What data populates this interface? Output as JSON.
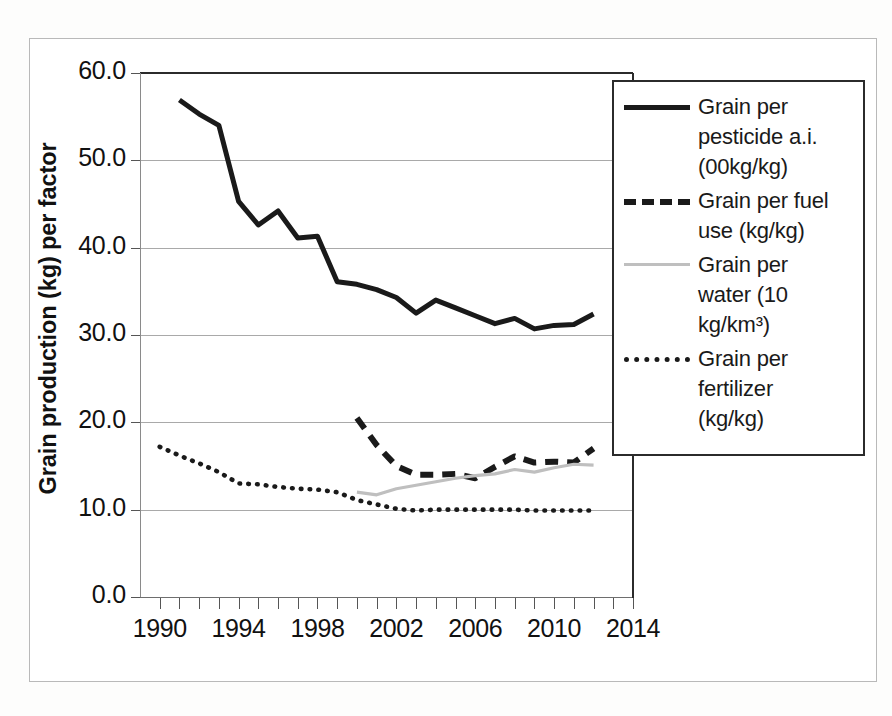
{
  "chart_data": {
    "type": "line",
    "title": "",
    "xlabel": "",
    "ylabel": "Grain production (kg) per factor",
    "xlim": [
      1989,
      2014
    ],
    "ylim": [
      0.0,
      60.0
    ],
    "grid": true,
    "legend_position": "right-inside",
    "y_ticks": [
      "60.0",
      "50.0",
      "40.0",
      "30.0",
      "20.0",
      "10.0",
      "0.0"
    ],
    "y_tick_values": [
      60.0,
      50.0,
      40.0,
      30.0,
      20.0,
      10.0,
      0.0
    ],
    "x_ticks": [
      "1990",
      "1994",
      "1998",
      "2002",
      "2006",
      "2010",
      "2014"
    ],
    "x_tick_values": [
      1990,
      1994,
      1998,
      2002,
      2006,
      2010,
      2014
    ],
    "series": [
      {
        "name": "Grain per pesticide a.i. (00kg/kg)",
        "style": "solid",
        "color": "#1a1a1a",
        "x": [
          1991,
          1992,
          1993,
          1994,
          1995,
          1996,
          1997,
          1998,
          1999,
          2000,
          2001,
          2002,
          2003,
          2004,
          2005,
          2006,
          2007,
          2008,
          2009,
          2010,
          2011,
          2012
        ],
        "values": [
          56.9,
          55.3,
          54.0,
          45.3,
          42.6,
          44.2,
          41.1,
          41.3,
          36.1,
          35.8,
          35.2,
          34.3,
          32.5,
          34.0,
          33.1,
          32.2,
          31.3,
          31.9,
          30.7,
          31.1,
          31.2,
          32.4
        ]
      },
      {
        "name": "Grain per fuel use (kg/kg)",
        "style": "dashed",
        "color": "#1a1a1a",
        "x": [
          2000,
          2001,
          2002,
          2003,
          2004,
          2005,
          2006,
          2007,
          2008,
          2009,
          2010,
          2011,
          2012
        ],
        "values": [
          20.5,
          17.4,
          15.0,
          14.0,
          14.0,
          14.1,
          13.6,
          14.9,
          16.1,
          15.4,
          15.5,
          15.4,
          17.0
        ]
      },
      {
        "name": "Grain per water (10 kg/km³)",
        "style": "solid-grey",
        "color": "#bfbfbf",
        "x": [
          2000,
          2001,
          2002,
          2003,
          2004,
          2005,
          2006,
          2007,
          2008,
          2009,
          2010,
          2011,
          2012
        ],
        "values": [
          12.0,
          11.7,
          12.4,
          12.8,
          13.2,
          13.6,
          13.9,
          14.1,
          14.6,
          14.3,
          14.8,
          15.2,
          15.1
        ]
      },
      {
        "name": "Grain per fertilizer (kg/kg)",
        "style": "dotted",
        "color": "#1a1a1a",
        "x": [
          1990,
          1991,
          1992,
          1993,
          1994,
          1995,
          1996,
          1997,
          1998,
          1999,
          2000,
          2001,
          2002,
          2003,
          2004,
          2005,
          2006,
          2007,
          2008,
          2009,
          2010,
          2011,
          2012
        ],
        "values": [
          17.2,
          16.2,
          15.3,
          14.3,
          13.0,
          12.9,
          12.6,
          12.4,
          12.3,
          12.0,
          11.1,
          10.6,
          10.1,
          9.9,
          10.0,
          10.0,
          10.0,
          10.0,
          10.0,
          9.9,
          9.9,
          9.9,
          9.9
        ]
      }
    ]
  },
  "axes": {
    "y_title": "Grain production (kg) per factor",
    "y_tick_labels": [
      "60.0",
      "50.0",
      "40.0",
      "30.0",
      "20.0",
      "10.0",
      "0.0"
    ],
    "x_tick_labels": [
      "1990",
      "1994",
      "1998",
      "2002",
      "2006",
      "2010",
      "2014"
    ]
  },
  "legend": {
    "items": [
      {
        "marker": "solid-line",
        "label": "Grain per\npesticide a.i.\n(00kg/kg)"
      },
      {
        "marker": "dashed-line",
        "label": "Grain per fuel\nuse (kg/kg)"
      },
      {
        "marker": "grey-line",
        "label": "Grain per\nwater (10\nkg/km³)"
      },
      {
        "marker": "dotted-line",
        "label": "Grain per\nfertilizer\n(kg/kg)"
      }
    ]
  },
  "caption": {
    "text": ""
  },
  "colors": {
    "series_primary": "#1a1a1a",
    "series_grey": "#bfbfbf",
    "gridline": "#a9a9a9",
    "frame": "#b9b9b9"
  }
}
